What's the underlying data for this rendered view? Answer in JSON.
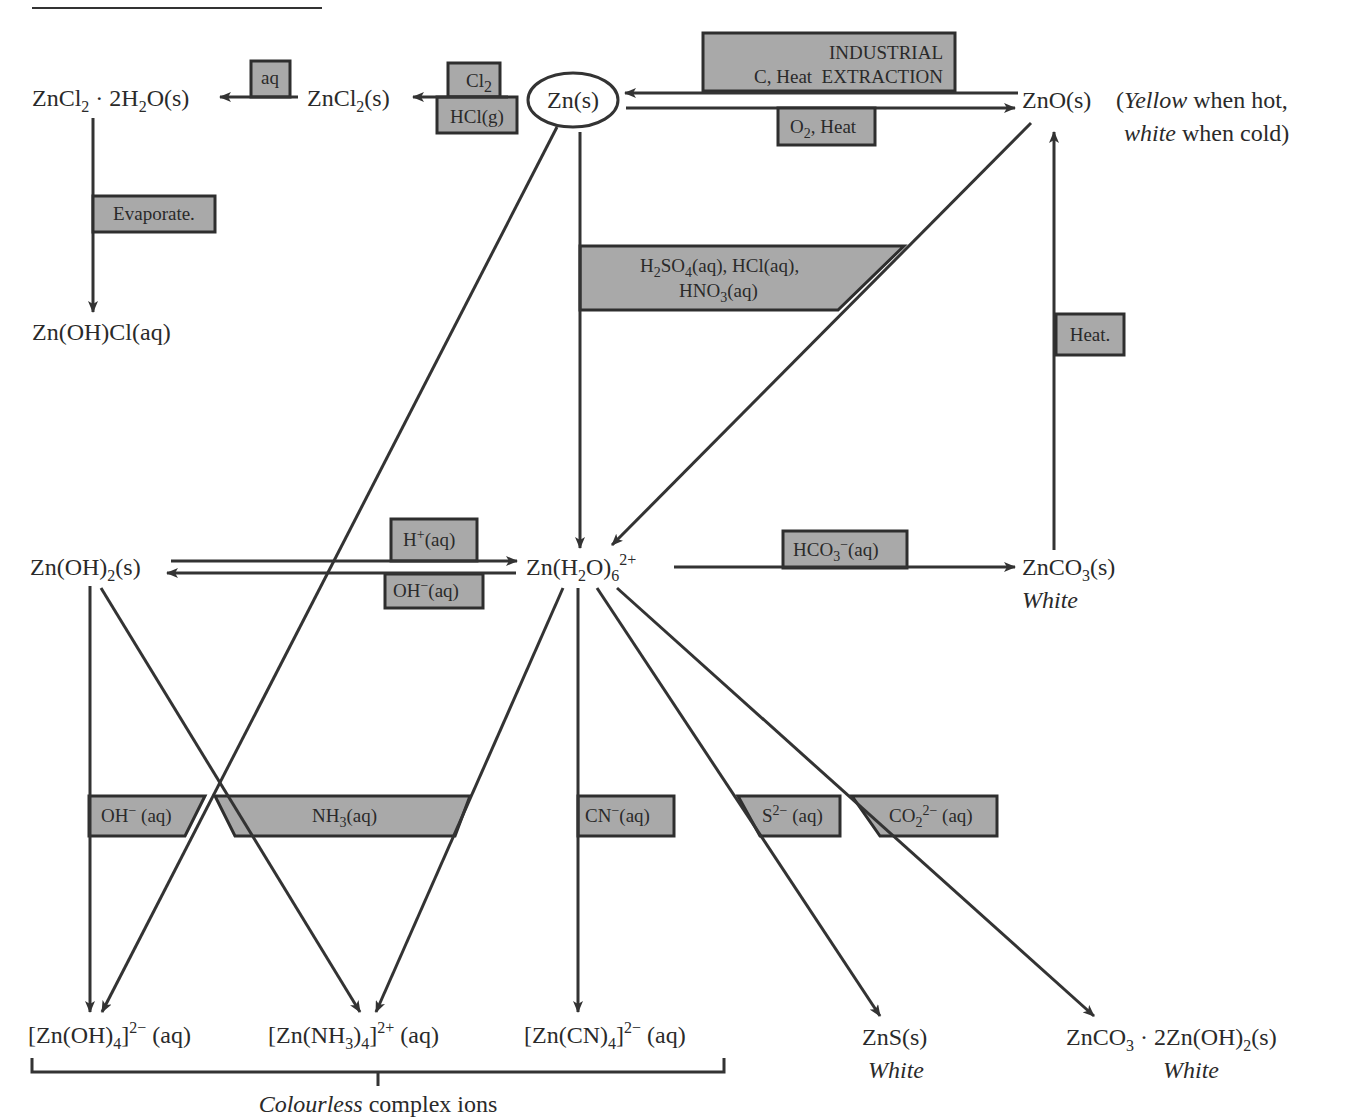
{
  "diagram": {
    "title_rule": "",
    "nodes": {
      "zncl2_hydrate": {
        "main": "ZnCl",
        "s1": "2",
        "mid": " · 2H",
        "s2": "2",
        "end": "O(s)"
      },
      "zncl2": {
        "main": "ZnCl",
        "s1": "2",
        "end": "(s)"
      },
      "zn": {
        "label": "Zn(s)"
      },
      "zno": {
        "label": "ZnO(s)"
      },
      "zno_note": {
        "open": "(",
        "yellow": "Yellow",
        "line1_rest": " when hot,",
        "white": "white",
        "line2_rest": " when cold)"
      },
      "znohcl": {
        "label": "Zn(OH)Cl(aq)"
      },
      "znoh2": {
        "main": "Zn(OH)",
        "s1": "2",
        "end": "(s)"
      },
      "znh2o6": {
        "main": "Zn(H",
        "s1": "2",
        "mid": "O)",
        "s2": "6",
        "sup": "2+"
      },
      "znco3": {
        "main": "ZnCO",
        "s1": "3",
        "end": "(s)",
        "color": "White"
      },
      "znoh4": {
        "main": "[Zn(OH)",
        "s1": "4",
        "mid": "]",
        "sup": "2−",
        "end": " (aq)"
      },
      "znnh34": {
        "main": "[Zn(NH",
        "s1": "3",
        "mid": ")",
        "s2": "4",
        "mid2": "]",
        "sup": "2+",
        "end": " (aq)"
      },
      "zncn4": {
        "main": "[Zn(CN)",
        "s1": "4",
        "mid": "]",
        "sup": "2−",
        "end": " (aq)"
      },
      "zns": {
        "label": "ZnS(s)",
        "color": "White"
      },
      "basic_carbonate": {
        "main": "ZnCO",
        "s1": "3",
        "mid": " · 2Zn(OH)",
        "s2": "2",
        "end": "(s)",
        "color": "White"
      }
    },
    "conditions": {
      "aq": "aq",
      "cl2": {
        "main": "Cl",
        "s1": "2"
      },
      "hclg": "HCl(g)",
      "industrial_line1": "INDUSTRIAL",
      "industrial_line2": "C, Heat  EXTRACTION",
      "o2_heat": {
        "main": "O",
        "s1": "2",
        "end": ", Heat"
      },
      "evaporate": "Evaporate.",
      "acids_line1": {
        "a": "H",
        "s1": "2",
        "b": "SO",
        "s2": "4",
        "c": "(aq), HCl(aq),"
      },
      "acids_line2": {
        "a": "HNO",
        "s1": "3",
        "c": "(aq)"
      },
      "heat": "Heat.",
      "h_plus": {
        "main": "H",
        "sup": "+",
        "end": "(aq)"
      },
      "oh_minus": {
        "main": "OH",
        "sup": "−",
        "end": "(aq)"
      },
      "hco3": {
        "main": "HCO",
        "s1": "3",
        "sup": "−",
        "end": "(aq)"
      },
      "oh_minus2": {
        "main": "OH",
        "sup": "−",
        "end": " (aq)"
      },
      "nh3": {
        "main": "NH",
        "s1": "3",
        "end": "(aq)"
      },
      "cn_minus": {
        "main": "CN",
        "sup": "−",
        "end": "(aq)"
      },
      "s2_minus": {
        "main": "S",
        "sup": "2−",
        "end": " (aq)"
      },
      "co2_2minus": {
        "main": "CO",
        "s1": "2",
        "sup": "2−",
        "end": " (aq)"
      }
    },
    "bracket_label": {
      "italic": "Colourless",
      "rest": " complex ions"
    },
    "colors": {
      "box_fill": "#a9a9a9",
      "line": "#333333",
      "background": "#ffffff"
    }
  }
}
